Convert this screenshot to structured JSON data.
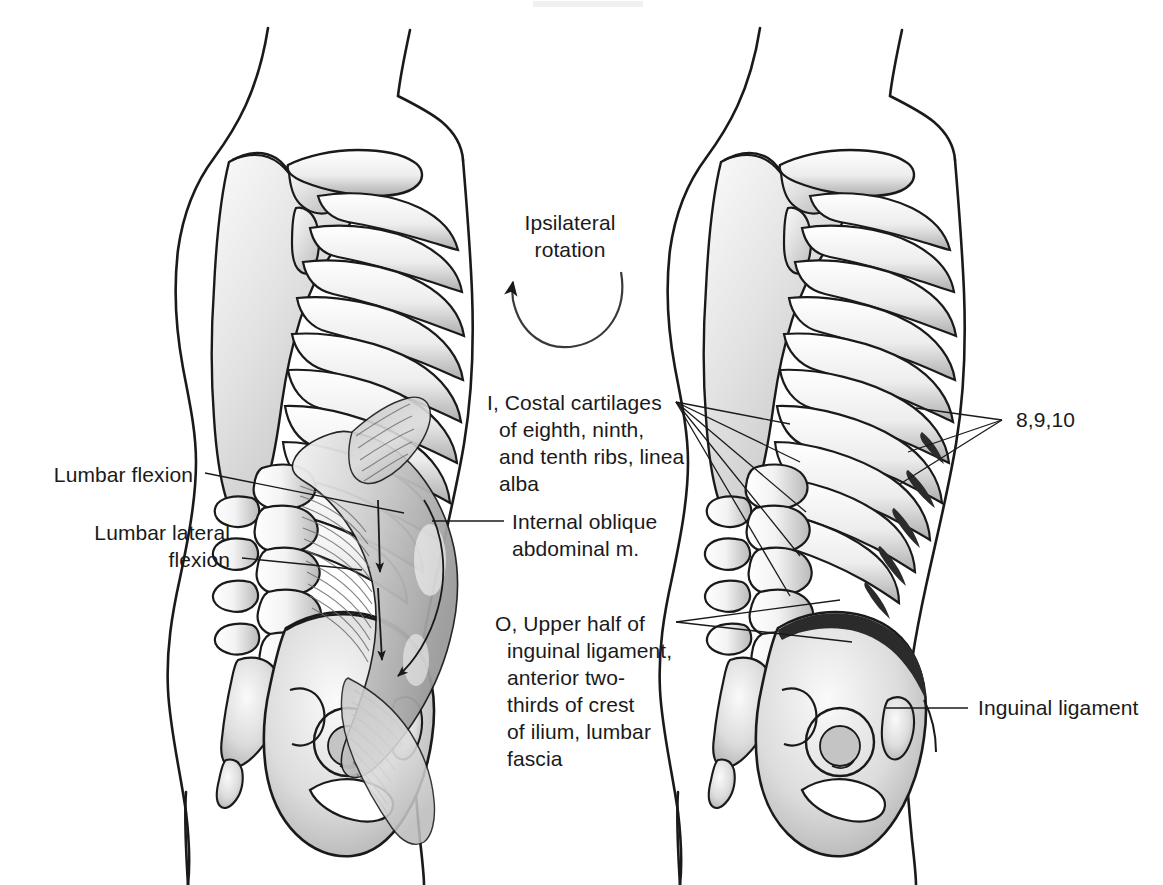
{
  "plate": {
    "title": "Internal oblique abdominal muscle",
    "background_color": "#ffffff",
    "ink_color": "#1a1a1a",
    "width": 1163,
    "height": 885
  },
  "labels": {
    "ipsilateral_rotation": "Ipsilateral\nrotation",
    "lumbar_flexion": "Lumbar flexion",
    "lumbar_lateral_flexion": "Lumbar lateral\nflexion",
    "insertion": "I, Costal cartilages\nof eighth, ninth,\nand tenth ribs, linea\nalba",
    "internal_oblique": "Internal oblique\nabdominal m.",
    "origin": "O, Upper half of\ninguinal ligament,\nanterior two-\nthirds of crest\nof ilium, lumbar\nfascia",
    "rib_numbers": "8,9,10",
    "inguinal_ligament": "Inguinal ligament"
  },
  "figures": {
    "left": {
      "name": "left-figure-muscle-view",
      "caption": "Lateral trunk with internal oblique abdominal muscle shown in situ over ribs, lumbar spine and pelvis"
    },
    "right": {
      "name": "right-figure-skeleton-view",
      "caption": "Lateral trunk skeleton showing muscle attachment sites on ribs 8, 9, 10 and iliac crest"
    }
  },
  "annotations": {
    "rotation_arrow": "curved-arrow-counterclockwise",
    "muscle_fiber_arrows": "downward-fiber-direction-arrows"
  },
  "colors": {
    "ink": "#1a1a1a",
    "bone_shade_light": "#ebebeb",
    "bone_shade_mid": "#c9c9c9",
    "bone_shade_dark": "#8f8f8f",
    "attachment_mark": "#2b2b2b",
    "muscle_shade": "#d6d6d6"
  }
}
